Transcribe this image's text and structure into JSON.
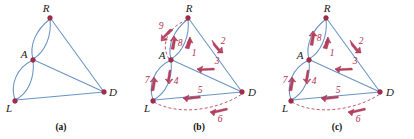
{
  "figure": {
    "colors": {
      "edge": "#6a94c4",
      "vertex": "#a32c4a",
      "arrow": "#b8415f",
      "dashed_edge": "#c05a70",
      "label": "#1a1a1a",
      "number_label": "#b23050",
      "background": "#ffffff"
    },
    "panels": [
      {
        "id": "a",
        "caption": "(a)",
        "vertices": [
          {
            "id": "R",
            "label": "R",
            "x": 50,
            "y": 18
          },
          {
            "id": "A",
            "label": "A",
            "x": 33,
            "y": 60
          },
          {
            "id": "L",
            "label": "L",
            "x": 15,
            "y": 101
          },
          {
            "id": "D",
            "label": "D",
            "x": 104,
            "y": 92
          }
        ],
        "edges": [
          {
            "from": "R",
            "to": "A",
            "style": "curve-left"
          },
          {
            "from": "R",
            "to": "A",
            "style": "curve-right"
          },
          {
            "from": "A",
            "to": "L",
            "style": "curve-left"
          },
          {
            "from": "A",
            "to": "L",
            "style": "curve-right"
          },
          {
            "from": "R",
            "to": "D",
            "style": "straight"
          },
          {
            "from": "A",
            "to": "D",
            "style": "straight"
          },
          {
            "from": "L",
            "to": "D",
            "style": "straight"
          }
        ],
        "arrows": []
      },
      {
        "id": "b",
        "caption": "(b)",
        "vertices": [
          {
            "id": "R",
            "label": "R",
            "x": 50,
            "y": 18
          },
          {
            "id": "A",
            "label": "A",
            "x": 33,
            "y": 60
          },
          {
            "id": "L",
            "label": "L",
            "x": 15,
            "y": 101
          },
          {
            "id": "D",
            "label": "D",
            "x": 104,
            "y": 92
          }
        ],
        "edges": [
          {
            "from": "R",
            "to": "A",
            "style": "curve-left"
          },
          {
            "from": "R",
            "to": "A",
            "style": "curve-right"
          },
          {
            "from": "A",
            "to": "L",
            "style": "curve-left"
          },
          {
            "from": "A",
            "to": "L",
            "style": "curve-right"
          },
          {
            "from": "R",
            "to": "D",
            "style": "straight"
          },
          {
            "from": "A",
            "to": "D",
            "style": "straight"
          },
          {
            "from": "L",
            "to": "D",
            "style": "straight"
          },
          {
            "from": "R",
            "to": "A",
            "style": "dashed-outer"
          },
          {
            "from": "L",
            "to": "D",
            "style": "dashed-outer"
          }
        ],
        "arrows": [
          {
            "label": "1",
            "edge": "A-R",
            "direction": "up"
          },
          {
            "label": "2",
            "edge": "R-D",
            "direction": "down-right"
          },
          {
            "label": "3",
            "edge": "D-A",
            "direction": "left"
          },
          {
            "label": "4",
            "edge": "A-L",
            "direction": "down"
          },
          {
            "label": "5",
            "edge": "D-L",
            "direction": "left"
          },
          {
            "label": "6",
            "edge": "D-L-dashed",
            "direction": "left"
          },
          {
            "label": "7",
            "edge": "L-A",
            "direction": "up"
          },
          {
            "label": "8",
            "edge": "A-R",
            "direction": "up"
          },
          {
            "label": "9",
            "edge": "R-A-dashed",
            "direction": "down-left"
          }
        ]
      },
      {
        "id": "c",
        "caption": "(c)",
        "vertices": [
          {
            "id": "R",
            "label": "R",
            "x": 50,
            "y": 18
          },
          {
            "id": "A",
            "label": "A",
            "x": 33,
            "y": 60
          },
          {
            "id": "L",
            "label": "L",
            "x": 15,
            "y": 101
          },
          {
            "id": "D",
            "label": "D",
            "x": 104,
            "y": 92
          }
        ],
        "edges": [
          {
            "from": "R",
            "to": "A",
            "style": "curve-left"
          },
          {
            "from": "R",
            "to": "A",
            "style": "curve-right"
          },
          {
            "from": "A",
            "to": "L",
            "style": "curve-left"
          },
          {
            "from": "A",
            "to": "L",
            "style": "curve-right"
          },
          {
            "from": "R",
            "to": "D",
            "style": "straight"
          },
          {
            "from": "A",
            "to": "D",
            "style": "straight"
          },
          {
            "from": "L",
            "to": "D",
            "style": "straight"
          },
          {
            "from": "L",
            "to": "D",
            "style": "dashed-outer"
          }
        ],
        "arrows": [
          {
            "label": "1",
            "edge": "A-R",
            "direction": "up"
          },
          {
            "label": "2",
            "edge": "R-D",
            "direction": "down-right"
          },
          {
            "label": "3",
            "edge": "D-A",
            "direction": "left"
          },
          {
            "label": "4",
            "edge": "A-L",
            "direction": "down"
          },
          {
            "label": "5",
            "edge": "D-L",
            "direction": "left"
          },
          {
            "label": "6",
            "edge": "D-L-dashed",
            "direction": "left"
          },
          {
            "label": "7",
            "edge": "L-A",
            "direction": "up"
          },
          {
            "label": "8",
            "edge": "A-R",
            "direction": "up"
          }
        ]
      }
    ]
  },
  "labels": {
    "R": "R",
    "A": "A",
    "L": "L",
    "D": "D",
    "n1": "1",
    "n2": "2",
    "n3": "3",
    "n4": "4",
    "n5": "5",
    "n6": "6",
    "n7": "7",
    "n8": "8",
    "n9": "9",
    "cap_a": "(a)",
    "cap_b": "(b)",
    "cap_c": "(c)"
  }
}
